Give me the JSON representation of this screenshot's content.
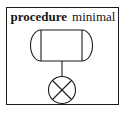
{
  "caption": {
    "keyword": "procedure",
    "name": "minimal"
  },
  "colors": {
    "ink": "#1c1c1c",
    "background": "#ffffff"
  },
  "diagram": {
    "nodes": [
      {
        "id": "rounded-box-node",
        "shape": "stadium-with-chords",
        "label": ""
      },
      {
        "id": "crossed-circle-node",
        "shape": "circle-with-x",
        "label": ""
      }
    ],
    "edges": [
      {
        "from": "rounded-box-node",
        "to": "crossed-circle-node"
      }
    ]
  }
}
